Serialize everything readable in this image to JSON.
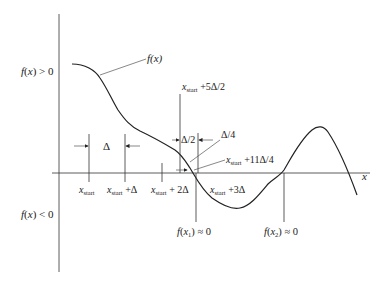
{
  "diagram": {
    "type": "bisection/incremental-search root bracketing",
    "curve_label": "f(x)",
    "x_axis_label": "x",
    "region_labels": {
      "positive": "f(x) > 0",
      "negative": "f(x) < 0"
    },
    "increment_labels": {
      "delta": "Δ",
      "half_delta": "Δ/2",
      "quarter_delta": "Δ/4"
    },
    "x_ticks": [
      {
        "base": "x",
        "sub": "start",
        "suffix": ""
      },
      {
        "base": "x",
        "sub": "start",
        "suffix": " +Δ"
      },
      {
        "base": "x",
        "sub": "start",
        "suffix": " + 2Δ"
      },
      {
        "base": "x",
        "sub": "start",
        "suffix": " +3Δ"
      }
    ],
    "annotations": {
      "five_half": {
        "base": "x",
        "sub": "start",
        "suffix": " +5Δ/2"
      },
      "eleven_quarter": {
        "base": "x",
        "sub": "start",
        "suffix": " +11Δ/4"
      }
    },
    "roots": [
      {
        "label": "f(x",
        "sub": "1",
        "suffix": ") ≈ 0"
      },
      {
        "label": "f(x",
        "sub": "2",
        "suffix": ") ≈ 0"
      }
    ],
    "colors": {
      "line": "#333333",
      "background": "#ffffff"
    }
  }
}
